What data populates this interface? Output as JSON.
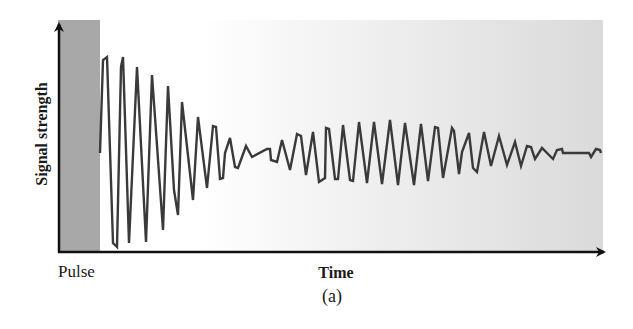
{
  "chart_data": {
    "type": "line",
    "title": "",
    "caption": "(a)",
    "xlabel": "Time",
    "ylabel": "Signal strength",
    "annotations": [
      "Pulse"
    ],
    "grid": false,
    "legend": null,
    "axis_ticks": "none",
    "pulse_region": {
      "x_start": 58,
      "x_end": 100,
      "color": "#a8a8a8"
    },
    "background_gradient": {
      "from": "#ffffff",
      "to": "#dadada",
      "start_x": 200,
      "end_x": 603
    },
    "line_color": "#3a3a3a",
    "points_px": [
      [
        100,
        153
      ],
      [
        103,
        60
      ],
      [
        107,
        57
      ],
      [
        113,
        243
      ],
      [
        117,
        247
      ],
      [
        121,
        67
      ],
      [
        123,
        57
      ],
      [
        129,
        243
      ],
      [
        137,
        67
      ],
      [
        146,
        242
      ],
      [
        152,
        75
      ],
      [
        163,
        230
      ],
      [
        168,
        86
      ],
      [
        174,
        190
      ],
      [
        178,
        215
      ],
      [
        182,
        102
      ],
      [
        193,
        200
      ],
      [
        198,
        117
      ],
      [
        207,
        188
      ],
      [
        213,
        126
      ],
      [
        216,
        127
      ],
      [
        220,
        179
      ],
      [
        223,
        178
      ],
      [
        225,
        153
      ],
      [
        230,
        138
      ],
      [
        235,
        167
      ],
      [
        238,
        168
      ],
      [
        246,
        146
      ],
      [
        252,
        157
      ],
      [
        267,
        149
      ],
      [
        270,
        149
      ],
      [
        271,
        160
      ],
      [
        277,
        162
      ],
      [
        282,
        140
      ],
      [
        290,
        170
      ],
      [
        297,
        134
      ],
      [
        301,
        136
      ],
      [
        306,
        175
      ],
      [
        313,
        132
      ],
      [
        319,
        182
      ],
      [
        325,
        178
      ],
      [
        326,
        128
      ],
      [
        329,
        129
      ],
      [
        335,
        179
      ],
      [
        338,
        179
      ],
      [
        343,
        125
      ],
      [
        350,
        180
      ],
      [
        353,
        181
      ],
      [
        359,
        122
      ],
      [
        367,
        183
      ],
      [
        374,
        122
      ],
      [
        382,
        184
      ],
      [
        390,
        120
      ],
      [
        398,
        185
      ],
      [
        405,
        123
      ],
      [
        414,
        185
      ],
      [
        421,
        124
      ],
      [
        428,
        181
      ],
      [
        435,
        127
      ],
      [
        438,
        128
      ],
      [
        443,
        178
      ],
      [
        452,
        128
      ],
      [
        454,
        131
      ],
      [
        459,
        174
      ],
      [
        462,
        152
      ],
      [
        469,
        133
      ],
      [
        473,
        168
      ],
      [
        477,
        172
      ],
      [
        484,
        132
      ],
      [
        491,
        166
      ],
      [
        499,
        136
      ],
      [
        507,
        165
      ],
      [
        515,
        142
      ],
      [
        521,
        166
      ],
      [
        527,
        146
      ],
      [
        531,
        147
      ],
      [
        535,
        159
      ],
      [
        542,
        148
      ],
      [
        553,
        159
      ],
      [
        557,
        150
      ],
      [
        562,
        149
      ],
      [
        563,
        153
      ],
      [
        589,
        153
      ],
      [
        591,
        157
      ],
      [
        596,
        149
      ],
      [
        600,
        150
      ],
      [
        601,
        153
      ]
    ]
  },
  "labels": {
    "ylabel": "Signal strength",
    "xlabel": "Time",
    "pulse": "Pulse",
    "caption": "(a)"
  }
}
